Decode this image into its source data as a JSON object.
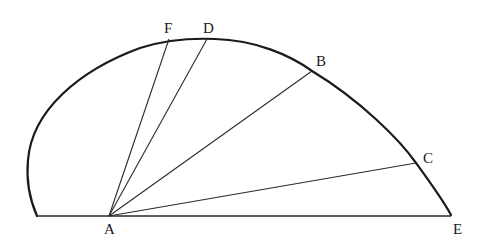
{
  "diagram": {
    "type": "geometric figure",
    "points": {
      "A": {
        "label": "A",
        "x": 109,
        "y": 216,
        "label_x": 104,
        "label_y": 234
      },
      "F": {
        "label": "F",
        "x": 169,
        "y": 39,
        "label_x": 164,
        "label_y": 33
      },
      "D": {
        "label": "D",
        "x": 207,
        "y": 39,
        "label_x": 203,
        "label_y": 33
      },
      "B": {
        "label": "B",
        "x": 312,
        "y": 71,
        "label_x": 316,
        "label_y": 66
      },
      "C": {
        "label": "C",
        "x": 416,
        "y": 163,
        "label_x": 423,
        "label_y": 163
      },
      "E": {
        "label": "E",
        "x": 451,
        "y": 215,
        "label_x": 453,
        "label_y": 234
      }
    },
    "rays_from_A": [
      "F",
      "D",
      "B",
      "C",
      "E"
    ],
    "base_line": {
      "from_x": 37,
      "to_x": 451,
      "y": 216
    },
    "colors": {
      "stroke": "#1a1a1a",
      "background": "#ffffff"
    }
  }
}
